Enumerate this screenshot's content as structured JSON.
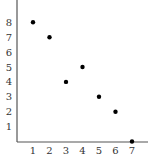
{
  "chart_data": {
    "type": "scatter",
    "title": "",
    "xlabel": "",
    "ylabel": "",
    "x": [
      1,
      2,
      3,
      4,
      5,
      6,
      7
    ],
    "y": [
      8,
      7,
      4,
      5,
      3,
      2,
      0
    ],
    "points": [
      {
        "x": 1,
        "y": 8
      },
      {
        "x": 2,
        "y": 7
      },
      {
        "x": 3,
        "y": 4
      },
      {
        "x": 4,
        "y": 5
      },
      {
        "x": 5,
        "y": 3
      },
      {
        "x": 6,
        "y": 2
      },
      {
        "x": 7,
        "y": 0
      }
    ],
    "xticks": [
      "1",
      "2",
      "3",
      "4",
      "5",
      "6",
      "7"
    ],
    "yticks": [
      "1",
      "2",
      "3",
      "4",
      "5",
      "6",
      "7",
      "8"
    ],
    "xlim": [
      0,
      8
    ],
    "ylim": [
      0,
      9
    ],
    "grid": false,
    "legend": null
  },
  "colors": {
    "axis": "#555555",
    "point": "#000000",
    "label": "#333333"
  }
}
